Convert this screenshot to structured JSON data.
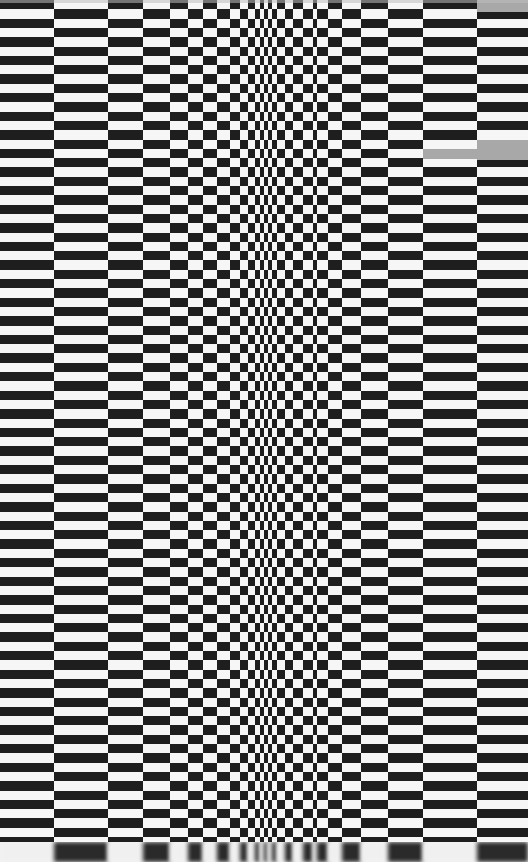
{
  "artwork": {
    "description": "Op-art checkerboard of black and white rectangles whose column widths compress toward the center, creating an illusion of a fold",
    "colors": {
      "dark": "#1e1e1e",
      "light": "#f6f6f6",
      "patch": "#a8a8a8"
    },
    "row_height": 9.3,
    "column_edges": [
      0,
      54,
      108,
      143,
      170,
      188,
      203,
      217,
      230,
      240,
      248,
      255,
      260,
      264,
      268,
      272,
      277,
      285,
      293,
      303,
      313,
      317,
      328,
      342,
      361,
      388,
      423,
      477,
      528
    ],
    "gray_patches": [
      {
        "x": 423,
        "y": 149,
        "w": 54,
        "h": 10
      },
      {
        "x": 477,
        "y": 140,
        "w": 51,
        "h": 20
      },
      {
        "x": 477,
        "y": 0,
        "w": 51,
        "h": 12
      }
    ]
  }
}
